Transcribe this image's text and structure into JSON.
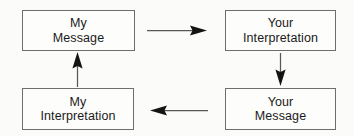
{
  "diagram": {
    "background_color": "#fbfbf9",
    "box_border_color": "#6e6e6e",
    "text_color": "#1a1a1a",
    "arrow_color": "#575757",
    "arrowhead_color": "#141414",
    "nodes": [
      {
        "id": "my-message",
        "line1": "My",
        "line2": "Message",
        "position": "top-left"
      },
      {
        "id": "your-interpretation",
        "line1": "Your",
        "line2": "Interpretation",
        "position": "top-right"
      },
      {
        "id": "my-interpretation",
        "line1": "My",
        "line2": "Interpretation",
        "position": "bottom-left"
      },
      {
        "id": "your-message",
        "line1": "Your",
        "line2": "Message",
        "position": "bottom-right"
      }
    ],
    "arrows": [
      {
        "id": "my-message-to-your-interpretation",
        "direction": "right",
        "from": "my-message",
        "to": "your-interpretation"
      },
      {
        "id": "your-interpretation-to-your-message",
        "direction": "down",
        "from": "your-interpretation",
        "to": "your-message"
      },
      {
        "id": "your-message-to-my-interpretation",
        "direction": "left",
        "from": "your-message",
        "to": "my-interpretation"
      },
      {
        "id": "my-interpretation-to-my-message",
        "direction": "up",
        "from": "my-interpretation",
        "to": "my-message"
      }
    ]
  }
}
